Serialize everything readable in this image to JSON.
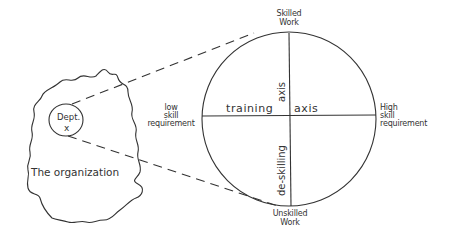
{
  "diagram": {
    "organization": {
      "label": "The organization",
      "department": {
        "label_line1": "Dept.",
        "label_line2": "x"
      }
    },
    "quadrant": {
      "top_label_line1": "Skilled",
      "top_label_line2": "Work",
      "bottom_label_line1": "Unskilled",
      "bottom_label_line2": "Work",
      "left_label_line1": "low",
      "left_label_line2": "skill",
      "left_label_line3": "requirement",
      "right_label_line1": "High",
      "right_label_line2": "skill",
      "right_label_line3": "requirement",
      "horizontal_axis_left": "training",
      "horizontal_axis_right": "axis",
      "vertical_axis_top": "axis",
      "vertical_axis_bottom": "de-skilling"
    },
    "colors": {
      "stroke": "#333333",
      "background": "#ffffff"
    }
  }
}
